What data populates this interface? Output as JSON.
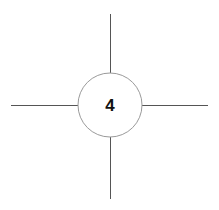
{
  "canvas": {
    "width": 219,
    "height": 210,
    "background_color": "#ffffff"
  },
  "diagram": {
    "type": "node-with-radiating-edges",
    "node": {
      "label": "4",
      "shape": "circle",
      "center_x": 110,
      "center_y": 105,
      "radius": 32,
      "stroke_color": "#9a9a9a",
      "stroke_width": 1,
      "fill_color": "#ffffff",
      "label_color": "#111111"
    },
    "edges": [
      {
        "name": "edge-up",
        "direction": "up",
        "x1": 110,
        "y1": 73,
        "x2": 110,
        "y2": 14,
        "stroke_color": "#555555",
        "stroke_width": 1
      },
      {
        "name": "edge-right",
        "direction": "right",
        "x1": 142,
        "y1": 105,
        "x2": 208,
        "y2": 105,
        "stroke_color": "#555555",
        "stroke_width": 1
      },
      {
        "name": "edge-down",
        "direction": "down",
        "x1": 110,
        "y1": 137,
        "x2": 110,
        "y2": 199,
        "stroke_color": "#555555",
        "stroke_width": 1
      },
      {
        "name": "edge-left",
        "direction": "left",
        "x1": 78,
        "y1": 105,
        "x2": 11,
        "y2": 105,
        "stroke_color": "#555555",
        "stroke_width": 1
      }
    ]
  }
}
